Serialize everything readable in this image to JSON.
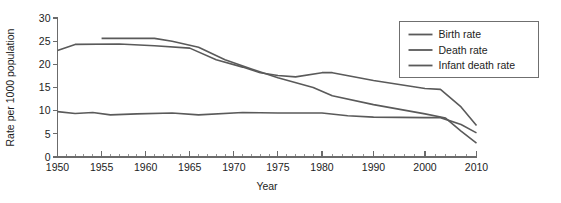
{
  "chart_data": {
    "type": "line",
    "title": "",
    "xlabel": "Year",
    "ylabel": "Rate per 1000 population",
    "xlim": [
      1950,
      2010
    ],
    "ylim": [
      0,
      30
    ],
    "yticks": [
      0,
      5,
      10,
      15,
      20,
      25,
      30
    ],
    "ytick_labels": [
      "0",
      "5",
      "10",
      "15",
      "20",
      "25",
      "30"
    ],
    "xticks": [
      1950,
      1955,
      1960,
      1965,
      1970,
      1975,
      1980,
      1990,
      2000,
      2010
    ],
    "xtick_labels": [
      "1950",
      "1955",
      "1960",
      "1965",
      "1970",
      "1975",
      "1980",
      "1990",
      "2000",
      "2010"
    ],
    "x_axis_note": "non-uniform: 5-year spacing 1950-1980, 10-year spacing 1980-2010",
    "minor_tick_step_early": 1,
    "minor_tick_step_late": 2,
    "grid": false,
    "legend_position": "upper right",
    "series": [
      {
        "name": "Birth rate",
        "color": "#5a5a5a",
        "x": [
          1950,
          1952,
          1957,
          1961,
          1965,
          1968,
          1971,
          1973,
          1975,
          1977,
          1980,
          1982,
          1990,
          2000,
          2003,
          2007,
          2010
        ],
        "values": [
          23.0,
          24.3,
          24.4,
          24.0,
          23.5,
          21.0,
          19.4,
          18.2,
          17.6,
          17.3,
          18.2,
          18.2,
          16.5,
          14.8,
          14.6,
          10.8,
          6.8
        ]
      },
      {
        "name": "Death rate",
        "color": "#5a5a5a",
        "x": [
          1950,
          1952,
          1954,
          1956,
          1959,
          1963,
          1966,
          1971,
          1975,
          1980,
          1985,
          1990,
          2000,
          2003,
          2007,
          2010
        ],
        "values": [
          9.8,
          9.4,
          9.6,
          9.1,
          9.3,
          9.5,
          9.1,
          9.6,
          9.5,
          9.5,
          8.9,
          8.6,
          8.5,
          8.5,
          7.0,
          5.2
        ]
      },
      {
        "name": "Infant death rate",
        "color": "#5a5a5a",
        "x": [
          1955,
          1961,
          1963,
          1966,
          1969,
          1972,
          1975,
          1979,
          1982,
          1990,
          2000,
          2004,
          2007,
          2010
        ],
        "values": [
          25.6,
          25.6,
          25.0,
          23.7,
          21.0,
          19.0,
          17.1,
          15.0,
          13.2,
          11.3,
          9.3,
          8.4,
          5.6,
          3.0
        ]
      }
    ]
  },
  "legend": {
    "items": [
      {
        "label": "Birth rate"
      },
      {
        "label": "Death rate"
      },
      {
        "label": "Infant death rate"
      }
    ]
  }
}
